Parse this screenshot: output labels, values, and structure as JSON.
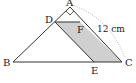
{
  "diagram": {
    "points": {
      "A": {
        "label": "A",
        "x": 70,
        "y": 7
      },
      "B": {
        "label": "B",
        "x": 13,
        "y": 62
      },
      "C": {
        "label": "C",
        "x": 122,
        "y": 62
      },
      "D": {
        "label": "D",
        "x": 55,
        "y": 22
      },
      "E": {
        "label": "E",
        "x": 94,
        "y": 62
      },
      "F": {
        "label": "F",
        "x": 80,
        "y": 22
      }
    },
    "measure_label": "12 cm",
    "right_angle_at": "A",
    "shaded_region": "DFCE",
    "shade_color": "#d0d0d0",
    "line_color": "#333333",
    "dotted_color": "#999999"
  }
}
